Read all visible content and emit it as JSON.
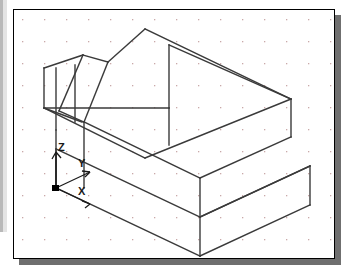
{
  "window": {
    "title": "Isometric Wireframe View",
    "background_color": "#ffffff",
    "frame_border_color": "#000000",
    "frame_shadow_color": "#6f6f6f",
    "left_strip_color": "#b9b9b9"
  },
  "canvas": {
    "name": "drawing-area",
    "width": 322,
    "height": 250,
    "background_color": "#ffffff",
    "grid": {
      "visible": true,
      "style": "dot",
      "spacing_px": 22,
      "dot_color": "#c9a9a9",
      "dot_size_px": 1
    }
  },
  "ucs": {
    "label_x": "X",
    "label_y": "Y",
    "label_z": "Z",
    "origin_marker": "filled-square",
    "origin_color": "#000000",
    "axis_color": "#1a1a1a"
  },
  "geometry": {
    "type": "isometric-wireframe",
    "description": "Rectangular block with chamfered upper-left corner",
    "line_color": "#3a3a3a",
    "line_width": 1.4,
    "visible_edges": 28
  }
}
